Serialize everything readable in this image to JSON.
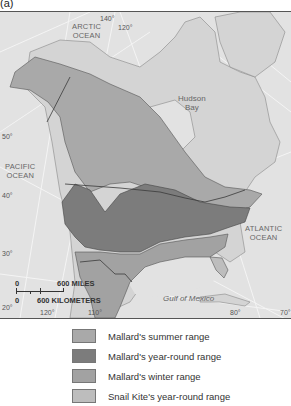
{
  "panel_label": "(a)",
  "map": {
    "water_labels": {
      "arctic": "ARCTIC\nOCEAN",
      "hudson": "Hudson\nBay",
      "pacific": "PACIFIC\nOCEAN",
      "atlantic": "ATLANTIC\nOCEAN",
      "gulf": "Gulf of Mexico"
    },
    "latitude_labels": [
      "50°",
      "40°",
      "30°",
      "20°"
    ],
    "longitude_labels": [
      "140°",
      "120°",
      "120°",
      "110°",
      "80°",
      "70°"
    ],
    "scale_bar": {
      "top_zero": "0",
      "miles": "600 MILES",
      "bottom_zero": "0",
      "kilometers": "600 KILOMETERS"
    }
  },
  "colors": {
    "ocean": "#e2e2e2",
    "land_other": "#d4d4d4",
    "summer": "#a9a9a9",
    "year_round": "#7c7c7c",
    "winter": "#a2a2a2",
    "snail_kite": "#bdbdbd",
    "border": "#3a3a3a"
  },
  "legend": [
    {
      "label": "Mallard's summer range",
      "color": "#a9a9a9"
    },
    {
      "label": "Mallard's year-round range",
      "color": "#7c7c7c"
    },
    {
      "label": "Mallard's winter range",
      "color": "#a2a2a2"
    },
    {
      "label": "Snail Kite's year-round range",
      "color": "#bdbdbd"
    }
  ]
}
